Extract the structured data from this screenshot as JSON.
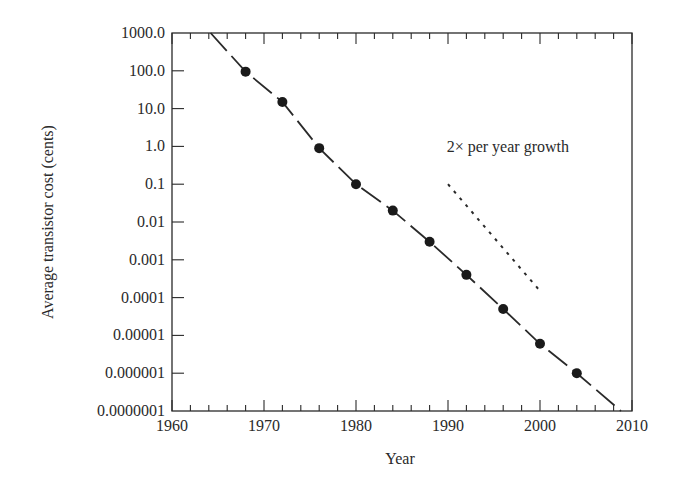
{
  "chart_data": {
    "type": "line",
    "title": "",
    "xlabel": "Year",
    "ylabel": "Average transistor cost (cents)",
    "xscale": "linear",
    "yscale": "log",
    "xlim": [
      1960,
      2010
    ],
    "ylim": [
      1e-07,
      1000.0
    ],
    "grid": false,
    "legend": null,
    "x_ticks": [
      1960,
      1970,
      1980,
      1990,
      2000,
      2010
    ],
    "x_tick_labels": [
      "1960",
      "1970",
      "1980",
      "1990",
      "2000",
      "2010"
    ],
    "y_ticks": [
      1000,
      100,
      10,
      1,
      0.1,
      0.01,
      0.001,
      0.0001,
      1e-05,
      1e-06,
      1e-07
    ],
    "y_tick_labels": [
      "1000.0",
      "100.0",
      "10.0",
      "1.0",
      "0.1",
      "0.01",
      "0.001",
      "0.0001",
      "0.00001",
      "0.000001",
      "0.0000001"
    ],
    "series": [
      {
        "name": "Average transistor cost",
        "style": "dashed line with filled circle markers",
        "x": [
          1964.2,
          1968,
          1972,
          1976,
          1980,
          1984,
          1988,
          1992,
          1996,
          2000,
          2004,
          2008.8
        ],
        "y": [
          1000,
          95,
          15,
          0.9,
          0.1,
          0.02,
          0.003,
          0.0004,
          5e-05,
          6e-06,
          1e-06,
          1e-07
        ],
        "markers": [
          {
            "x": 1968,
            "y": 95
          },
          {
            "x": 1972,
            "y": 15
          },
          {
            "x": 1976,
            "y": 0.9
          },
          {
            "x": 1980,
            "y": 0.1
          },
          {
            "x": 1984,
            "y": 0.02
          },
          {
            "x": 1988,
            "y": 0.003
          },
          {
            "x": 1992,
            "y": 0.0004
          },
          {
            "x": 1996,
            "y": 5e-05
          },
          {
            "x": 2000,
            "y": 6e-06
          },
          {
            "x": 2004,
            "y": 1e-06
          }
        ]
      },
      {
        "name": "2× per year growth reference",
        "style": "dotted line",
        "x": [
          1990,
          2000
        ],
        "y": [
          0.1,
          0.00015
        ]
      }
    ],
    "annotations": [
      {
        "text": "2× per year growth",
        "x": 1996.5,
        "y": 1.0
      }
    ]
  }
}
